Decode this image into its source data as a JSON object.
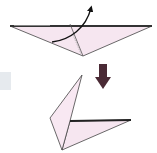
{
  "diagram": {
    "step_before": {
      "description": "Flat triangle with fold line and curved arrow indicating flap fold up",
      "paper_color": "#f6e6f0",
      "edge_color": "#3a3a3a"
    },
    "transition_arrow": {
      "icon": "down-arrow",
      "color": "#4a2a35"
    },
    "step_after": {
      "description": "Folded shape with flap raised upward",
      "paper_color": "#f6e6f0",
      "edge_color": "#3a3a3a"
    },
    "side_swatch_color": "#e6eaee"
  }
}
